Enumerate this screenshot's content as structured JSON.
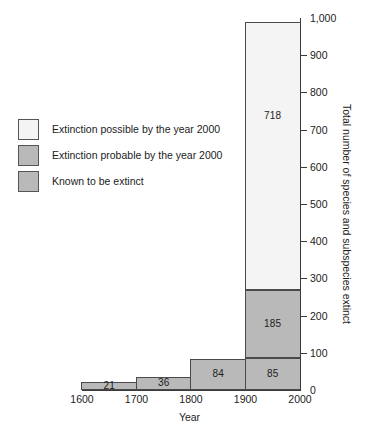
{
  "chart_data": {
    "type": "bar",
    "subtype": "stacked-bar",
    "title": "",
    "xlabel": "Year",
    "ylabel": "Total number of species and subspecies extinct",
    "xlim": [
      1600,
      2000
    ],
    "ylim": [
      0,
      1000
    ],
    "grid": false,
    "legend_position": "left-middle",
    "x_tick_labels": [
      "1600",
      "1700",
      "1800",
      "1900",
      "2000"
    ],
    "x_tick_values": [
      1600,
      1700,
      1800,
      1900,
      2000
    ],
    "y_tick_labels": [
      "0",
      "100",
      "200",
      "300",
      "400",
      "500",
      "600",
      "700",
      "800",
      "900",
      "1,000"
    ],
    "y_tick_values": [
      0,
      100,
      200,
      300,
      400,
      500,
      600,
      700,
      800,
      900,
      1000
    ],
    "categories": [
      "1600-1700",
      "1700-1800",
      "1800-1900",
      "1900-2000"
    ],
    "series": [
      {
        "name": "Known to be extinct",
        "color": "#b9b9b9",
        "values": [
          21,
          36,
          84,
          85
        ]
      },
      {
        "name": "Extinction probable by the year 2000",
        "color": "#b9b9b9",
        "values": [
          0,
          0,
          0,
          185
        ]
      },
      {
        "name": "Extinction possible by the year 2000",
        "color": "#f4f4f4",
        "values": [
          0,
          0,
          0,
          718
        ]
      }
    ],
    "bars": [
      {
        "category": "1600-1700",
        "x_start": 1600,
        "x_end": 1700,
        "total": 21,
        "segments": [
          {
            "series": "Known to be extinct",
            "value": 21,
            "label": "21",
            "base": 0,
            "color": "#b9b9b9"
          }
        ]
      },
      {
        "category": "1700-1800",
        "x_start": 1700,
        "x_end": 1800,
        "total": 36,
        "segments": [
          {
            "series": "Known to be extinct",
            "value": 36,
            "label": "36",
            "base": 0,
            "color": "#b9b9b9"
          }
        ]
      },
      {
        "category": "1800-1900",
        "x_start": 1800,
        "x_end": 1900,
        "total": 84,
        "segments": [
          {
            "series": "Known to be extinct",
            "value": 84,
            "label": "84",
            "base": 0,
            "color": "#b9b9b9"
          }
        ]
      },
      {
        "category": "1900-2000",
        "x_start": 1900,
        "x_end": 2000,
        "total": 988,
        "segments": [
          {
            "series": "Known to be extinct",
            "value": 85,
            "label": "85",
            "base": 0,
            "color": "#b9b9b9"
          },
          {
            "series": "Extinction probable by the year 2000",
            "value": 185,
            "label": "185",
            "base": 85,
            "color": "#b9b9b9"
          },
          {
            "series": "Extinction possible by the year 2000",
            "value": 718,
            "label": "718",
            "base": 270,
            "color": "#f4f4f4"
          }
        ]
      }
    ],
    "annotations": [
      "21",
      "36",
      "84",
      "85",
      "185",
      "718"
    ]
  },
  "legend": {
    "items": [
      {
        "label": "Extinction possible by the year 2000",
        "color": "#f4f4f4"
      },
      {
        "label": "Extinction probable by the year 2000",
        "color": "#b9b9b9"
      },
      {
        "label": "Known to be extinct",
        "color": "#b9b9b9"
      }
    ]
  },
  "colors": {
    "fill_light": "#f4f4f4",
    "fill_gray": "#b9b9b9",
    "stroke": "#4a4a4a",
    "axis": "#3a3a3a",
    "text": "#1c1c1c",
    "background": "#ffffff"
  }
}
